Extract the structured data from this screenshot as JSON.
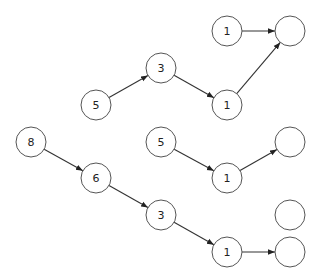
{
  "diagram": {
    "type": "directed-graph",
    "node_radius": 15,
    "stroke_color": "#555555",
    "edge_color": "#333333",
    "nodes": [
      {
        "id": "n_top1",
        "label": "1",
        "x": 227,
        "y": 31
      },
      {
        "id": "n_topE",
        "label": "",
        "x": 290,
        "y": 31
      },
      {
        "id": "n_3a",
        "label": "3",
        "x": 161,
        "y": 68
      },
      {
        "id": "n_5a",
        "label": "5",
        "x": 96,
        "y": 105
      },
      {
        "id": "n_1a",
        "label": "1",
        "x": 227,
        "y": 105
      },
      {
        "id": "n_8",
        "label": "8",
        "x": 31,
        "y": 142
      },
      {
        "id": "n_5b",
        "label": "5",
        "x": 161,
        "y": 142
      },
      {
        "id": "n_Eb",
        "label": "",
        "x": 290,
        "y": 142
      },
      {
        "id": "n_6",
        "label": "6",
        "x": 96,
        "y": 178
      },
      {
        "id": "n_1b",
        "label": "1",
        "x": 227,
        "y": 178
      },
      {
        "id": "n_3b",
        "label": "3",
        "x": 161,
        "y": 215
      },
      {
        "id": "n_Ec",
        "label": "",
        "x": 290,
        "y": 215
      },
      {
        "id": "n_1c",
        "label": "1",
        "x": 227,
        "y": 252
      },
      {
        "id": "n_Ed",
        "label": "",
        "x": 290,
        "y": 252
      }
    ],
    "edges": [
      {
        "from": "n_top1",
        "to": "n_topE"
      },
      {
        "from": "n_5a",
        "to": "n_3a"
      },
      {
        "from": "n_3a",
        "to": "n_1a"
      },
      {
        "from": "n_1a",
        "to": "n_topE"
      },
      {
        "from": "n_5b",
        "to": "n_1b"
      },
      {
        "from": "n_1b",
        "to": "n_Eb"
      },
      {
        "from": "n_8",
        "to": "n_6"
      },
      {
        "from": "n_6",
        "to": "n_3b"
      },
      {
        "from": "n_3b",
        "to": "n_1c"
      },
      {
        "from": "n_1c",
        "to": "n_Ed"
      }
    ]
  }
}
